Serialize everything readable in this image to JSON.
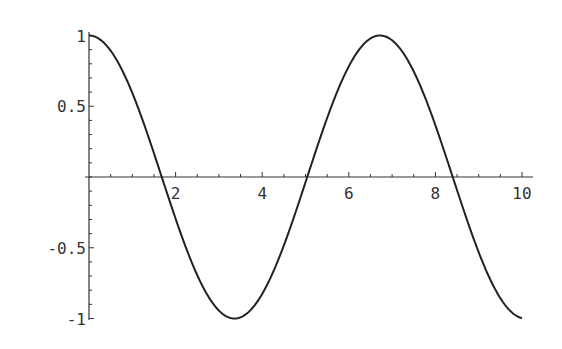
{
  "chart_data": {
    "type": "line",
    "title": "",
    "xlabel": "",
    "ylabel": "",
    "xlim": [
      0,
      10
    ],
    "ylim": [
      -1,
      1
    ],
    "grid": false,
    "legend": null,
    "x_ticks": [
      2,
      4,
      6,
      8,
      10
    ],
    "x_tick_labels": [
      "2",
      "4",
      "6",
      "8",
      "10"
    ],
    "y_ticks": [
      1,
      0.5,
      -0.5,
      -1
    ],
    "y_tick_labels": [
      "1",
      "0.5",
      "-0.5",
      "-1"
    ],
    "series": [
      {
        "name": "cos(0.935 x)",
        "function": "cos(0.935*x)",
        "color": "#222222",
        "x": [
          0,
          0.5,
          1,
          1.5,
          1.68,
          2,
          2.5,
          3,
          3.36,
          3.5,
          4,
          4.5,
          5,
          5.04,
          5.5,
          6,
          6.5,
          6.72,
          7,
          7.5,
          8,
          8.4,
          8.5,
          9,
          9.5,
          10
        ],
        "y": [
          1,
          0.89,
          0.59,
          0.17,
          0,
          -0.29,
          -0.69,
          -0.95,
          -1,
          -0.99,
          -0.83,
          -0.48,
          -0.05,
          0,
          0.4,
          0.77,
          0.98,
          1,
          0.97,
          0.72,
          0.34,
          0,
          -0.09,
          -0.51,
          -0.84,
          -1
        ]
      }
    ]
  },
  "axes": {
    "origin_px": [
      89,
      177
    ],
    "x_px_per_unit": 43.3,
    "y_px_per_unit": 141.5,
    "x_axis_end_px": 533,
    "y_axis_top_px": 32,
    "y_axis_bottom_px": 320
  }
}
